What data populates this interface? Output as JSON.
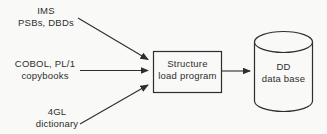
{
  "diagram": {
    "sources": [
      {
        "name": "ims",
        "line1": "IMS",
        "line2": "PSBs, DBDs"
      },
      {
        "name": "cobol",
        "line1": "COBOL, PL/1",
        "line2": "copybooks"
      },
      {
        "name": "fourgl",
        "line1": "4GL",
        "line2": "dictionary"
      }
    ],
    "process": {
      "line1": "Structure",
      "line2": "load program"
    },
    "datastore": {
      "line1": "DD",
      "line2": "data base"
    },
    "colors": {
      "ink": "#2e2e2e",
      "paper": "#f9f9f7"
    }
  }
}
